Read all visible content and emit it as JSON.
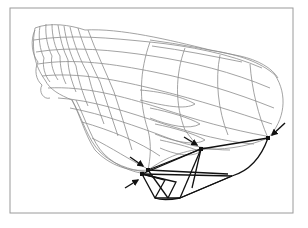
{
  "figure": {
    "type": "wireframe-illustration",
    "frame": {
      "x": 10,
      "y": 8,
      "width": 283,
      "height": 205,
      "stroke": "#9a9a9a"
    },
    "colors": {
      "mesh_gray": "#8c8c8c",
      "control_black": "#111111",
      "background": "#ffffff"
    },
    "control_points": [
      {
        "id": "p1",
        "x": 142,
        "y": 174
      },
      {
        "id": "p2",
        "x": 148,
        "y": 170
      },
      {
        "id": "p3",
        "x": 201,
        "y": 149
      },
      {
        "id": "p4",
        "x": 268,
        "y": 138
      }
    ],
    "arrows": [
      {
        "id": "a1",
        "from": [
          125,
          188
        ],
        "to": [
          138,
          180
        ]
      },
      {
        "id": "a2",
        "from": [
          130,
          157
        ],
        "to": [
          143,
          166
        ]
      },
      {
        "id": "a3",
        "from": [
          184,
          137
        ],
        "to": [
          197,
          145
        ]
      },
      {
        "id": "a4",
        "from": [
          285,
          123
        ],
        "to": [
          272,
          135
        ]
      }
    ]
  }
}
